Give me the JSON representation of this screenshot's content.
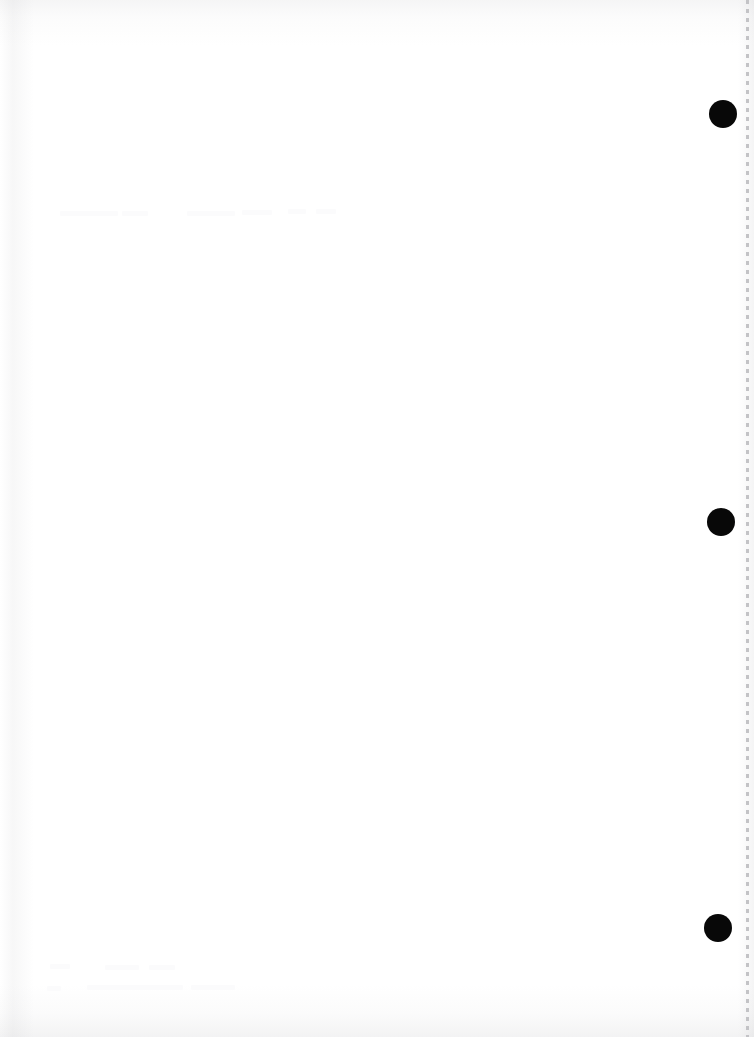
{
  "document": {
    "kind": "scanned-blank-page",
    "orientation": "portrait",
    "page_width": 754,
    "page_height": 1037,
    "background_color": "#ffffff",
    "description": "Blank reverse side of a hole-punched, perforated sheet"
  },
  "punch_holes": {
    "label": "binder punch holes",
    "count": 3,
    "color": "#080808",
    "items": [
      {
        "name": "punch-hole-top",
        "cx": 723,
        "cy": 114,
        "r": 14
      },
      {
        "name": "punch-hole-middle",
        "cx": 721,
        "cy": 522,
        "r": 14
      },
      {
        "name": "punch-hole-bottom",
        "cx": 718,
        "cy": 928,
        "r": 14
      }
    ]
  },
  "perforation": {
    "label": "tear-off perforation edge",
    "color": "#c3c3c6",
    "x": 746,
    "dash_length": 4,
    "gap_length": 5
  },
  "show_through": {
    "label": "faint bleed-through text from reverse side",
    "color": "#fbfbfc",
    "regions": [
      {
        "name": "show-through-upper",
        "x": 60,
        "y": 205,
        "bars": [
          {
            "x": 0,
            "y": 6,
            "w": 58
          },
          {
            "x": 62,
            "y": 6,
            "w": 26
          },
          {
            "x": 127,
            "y": 6,
            "w": 48
          },
          {
            "x": 182,
            "y": 5,
            "w": 30
          },
          {
            "x": 228,
            "y": 4,
            "w": 18
          },
          {
            "x": 256,
            "y": 4,
            "w": 20
          }
        ]
      },
      {
        "name": "show-through-lower",
        "x": 45,
        "y": 962,
        "bars": [
          {
            "x": 5,
            "y": 2,
            "w": 20
          },
          {
            "x": 60,
            "y": 3,
            "w": 34
          },
          {
            "x": 104,
            "y": 3,
            "w": 26
          },
          {
            "x": 2,
            "y": 24,
            "w": 14
          },
          {
            "x": 42,
            "y": 23,
            "w": 96
          },
          {
            "x": 146,
            "y": 23,
            "w": 44
          }
        ]
      }
    ]
  },
  "scan_artifacts": {
    "label": "scanner shading gradients",
    "edges": [
      "top",
      "bottom",
      "left",
      "right"
    ]
  }
}
